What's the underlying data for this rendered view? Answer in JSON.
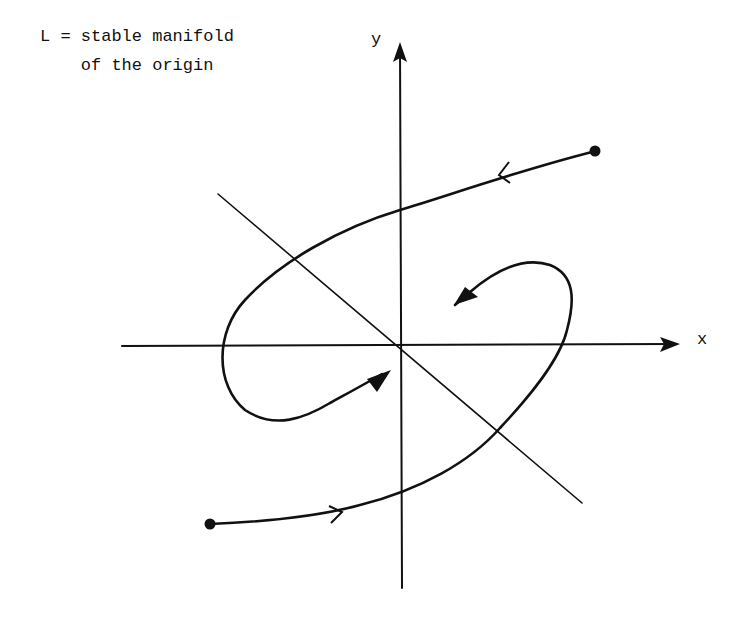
{
  "annotation": {
    "line1": "L = stable manifold",
    "line2": "    of the origin"
  },
  "axes": {
    "x_label": "x",
    "y_label": "y"
  },
  "elements": {
    "stable_manifold_line": "L",
    "trajectories": [
      {
        "name": "upper-trajectory",
        "start": "right dot",
        "direction": "inward spiral toward origin"
      },
      {
        "name": "lower-trajectory",
        "start": "left dot",
        "direction": "inward spiral toward origin"
      }
    ]
  },
  "colors": {
    "ink": "#111111",
    "background": "#ffffff"
  }
}
